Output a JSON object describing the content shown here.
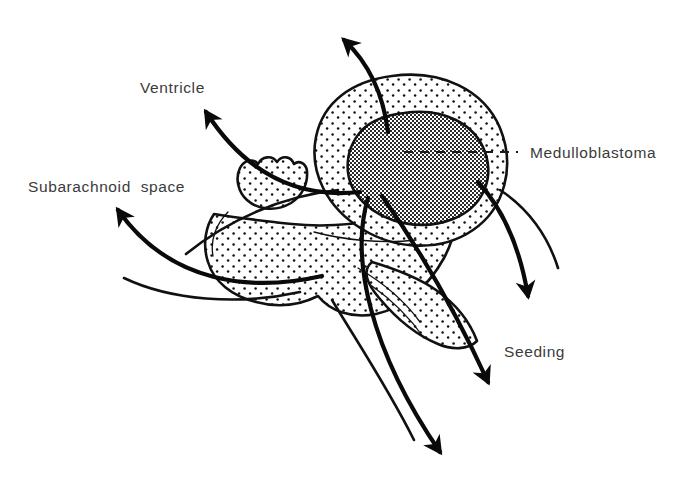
{
  "figure": {
    "background_color": "#ffffff",
    "ink_color": "#111111",
    "label_color": "#3b3b3b",
    "tumor_fill_color": "#8c8c8c",
    "stipple_fill_color": "#ffffff"
  },
  "labels": {
    "ventricle": "Ventricle",
    "subarachnoid_space": "Subarachnoid  space",
    "medulloblastoma": "Medulloblastoma",
    "seeding": "Seeding"
  },
  "structures": [
    {
      "name": "cerebellum",
      "texture": "stipple",
      "description": "stippled oval mass"
    },
    {
      "name": "medulloblastoma-tumor",
      "texture": "halftone-gray",
      "description": "dark shaded tumor within cerebellum"
    },
    {
      "name": "brainstem",
      "texture": "stipple",
      "description": "stippled lower structure"
    },
    {
      "name": "choroid-plexus",
      "texture": "stipple",
      "description": "scalloped stippled band"
    }
  ],
  "arrows": [
    {
      "name": "arrow-superior-ventricle",
      "direction": "up-left",
      "target_label": ""
    },
    {
      "name": "arrow-ventricle",
      "direction": "up-left",
      "target_label": "Ventricle"
    },
    {
      "name": "arrow-subarachnoid",
      "direction": "left-up",
      "target_label": "Subarachnoid  space"
    },
    {
      "name": "arrow-seeding-right",
      "direction": "down-right",
      "target_label": "Seeding"
    },
    {
      "name": "arrow-seeding-center",
      "direction": "down",
      "target_label": "Seeding"
    },
    {
      "name": "arrow-seeding-left",
      "direction": "down",
      "target_label": "Seeding"
    }
  ],
  "leader_lines": [
    {
      "name": "medulloblastoma-leader",
      "style": "dashed",
      "from": "tumor-center",
      "to": "Medulloblastoma"
    }
  ]
}
